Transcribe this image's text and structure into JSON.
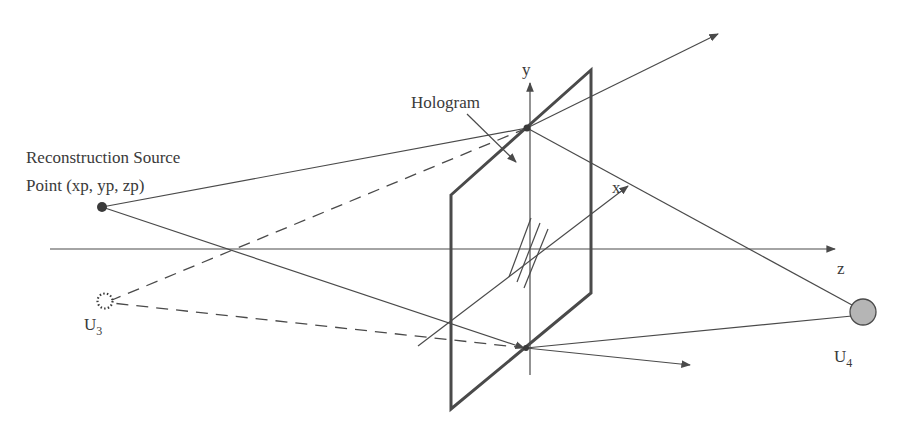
{
  "diagram": {
    "labels": {
      "source_line1": "Reconstruction Source",
      "source_line2": "Point (xp, yp, zp)",
      "hologram": "Hologram",
      "axis_y": "y",
      "axis_x": "x",
      "axis_z": "z",
      "u3_main": "U",
      "u3_sub": "3",
      "u4_main": "U",
      "u4_sub": "4"
    },
    "colors": {
      "line": "#4a4a4a",
      "u4_fill": "#b5b5b5",
      "source_point": "#3a3a3a"
    }
  }
}
